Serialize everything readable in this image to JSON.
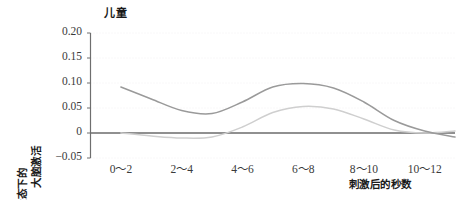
{
  "chart_data": {
    "type": "line",
    "title": "儿童",
    "xlabel": "刺激后的秒数",
    "ylabel_line1": "相对于静息状态下的",
    "ylabel_line2": "大脑激活",
    "categories": [
      "0～2",
      "2～4",
      "4～6",
      "6～8",
      "8～10",
      "10～12"
    ],
    "yticks": [
      "0.20",
      "0.15",
      "0.10",
      "0.05",
      "0",
      "−0.05"
    ],
    "ytick_values": [
      0.2,
      0.15,
      0.1,
      0.05,
      0,
      -0.05
    ],
    "ylim": [
      -0.05,
      0.2
    ],
    "xlim": [
      0,
      12
    ],
    "grid": true,
    "legend": "none",
    "zero_line": 0,
    "series": [
      {
        "name": "深色曲线",
        "color": "#9a9a9a",
        "x": [
          1,
          2,
          3,
          4,
          5,
          6,
          7,
          8,
          9,
          10,
          11,
          12
        ],
        "values": [
          0.092,
          0.068,
          0.045,
          0.039,
          0.062,
          0.092,
          0.099,
          0.09,
          0.062,
          0.025,
          0.004,
          -0.008
        ]
      },
      {
        "name": "浅色曲线",
        "color": "#cfcfcf",
        "x": [
          1,
          2,
          3,
          4,
          5,
          6,
          7,
          8,
          9,
          10,
          11,
          12
        ],
        "values": [
          0.0,
          -0.006,
          -0.01,
          -0.008,
          0.012,
          0.041,
          0.053,
          0.048,
          0.028,
          0.006,
          0.0,
          0.004
        ]
      }
    ]
  }
}
